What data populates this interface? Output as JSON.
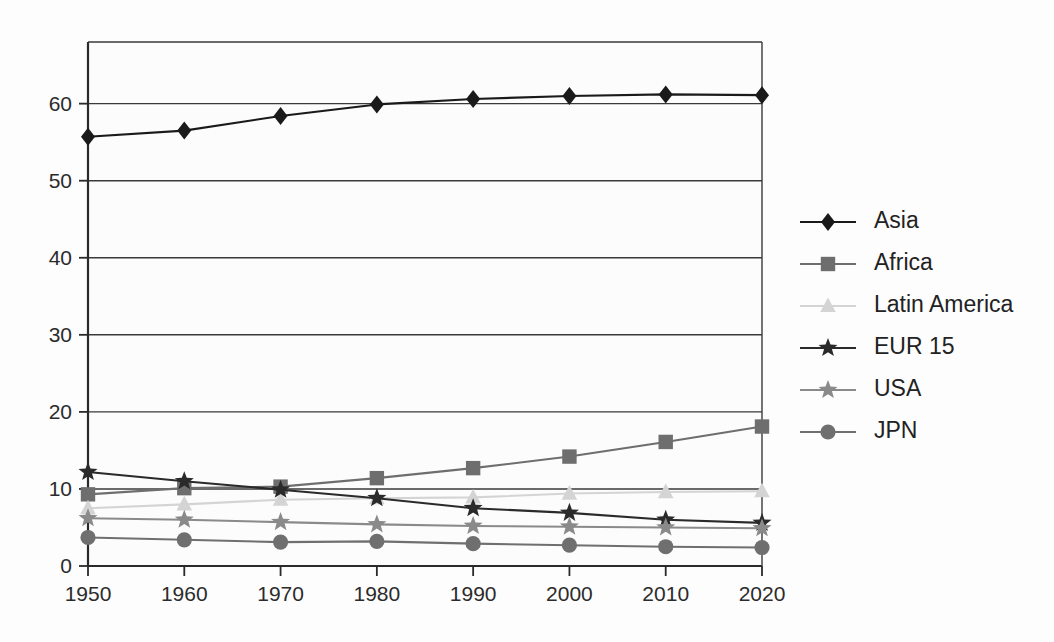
{
  "chart_data": {
    "type": "line",
    "title": "",
    "xlabel": "",
    "ylabel": "",
    "x": [
      1950,
      1960,
      1970,
      1980,
      1990,
      2000,
      2010,
      2020
    ],
    "categories": [
      "1950",
      "1960",
      "1970",
      "1980",
      "1990",
      "2000",
      "2010",
      "2020"
    ],
    "xlim": [
      1950,
      2020
    ],
    "ylim": [
      0,
      68
    ],
    "yticks": [
      0,
      10,
      20,
      30,
      40,
      50,
      60
    ],
    "ytick_labels": [
      "0",
      "10",
      "20",
      "30",
      "40",
      "50",
      "60"
    ],
    "grid": true,
    "grid_axis": "y",
    "legend_position": "right",
    "series": [
      {
        "name": "Asia",
        "marker": "diamond",
        "color": "#1a1a1a",
        "values": [
          55.7,
          56.5,
          58.4,
          59.9,
          60.6,
          61.0,
          61.2,
          61.1
        ]
      },
      {
        "name": "Africa",
        "marker": "square",
        "color": "#6e6e6e",
        "values": [
          9.3,
          10.1,
          10.3,
          11.4,
          12.7,
          14.2,
          16.1,
          18.1
        ]
      },
      {
        "name": "Latin America",
        "marker": "triangle",
        "color": "#d4d4d4",
        "values": [
          7.5,
          8.0,
          8.6,
          8.8,
          8.9,
          9.4,
          9.6,
          9.7
        ]
      },
      {
        "name": "EUR 15",
        "marker": "star",
        "color": "#2a2a2a",
        "values": [
          12.2,
          11.0,
          9.9,
          8.8,
          7.5,
          6.9,
          6.0,
          5.6
        ]
      },
      {
        "name": "USA",
        "marker": "star",
        "color": "#8a8a8a",
        "values": [
          6.2,
          6.0,
          5.7,
          5.4,
          5.2,
          5.1,
          5.0,
          4.9
        ]
      },
      {
        "name": "JPN",
        "marker": "circle",
        "color": "#6f6f6f",
        "values": [
          3.7,
          3.4,
          3.1,
          3.2,
          2.9,
          2.7,
          2.5,
          2.4
        ]
      }
    ]
  },
  "legend": {
    "items": [
      {
        "label": "Asia"
      },
      {
        "label": "Africa"
      },
      {
        "label": "Latin America"
      },
      {
        "label": "EUR 15"
      },
      {
        "label": "USA"
      },
      {
        "label": "JPN"
      }
    ]
  },
  "axes": {
    "y_tick_labels": [
      "0",
      "10",
      "20",
      "30",
      "40",
      "50",
      "60"
    ],
    "x_tick_labels": [
      "1950",
      "1960",
      "1970",
      "1980",
      "1990",
      "2000",
      "2010",
      "2020"
    ]
  },
  "colors": {
    "asia": "#1a1a1a",
    "africa": "#6e6e6e",
    "latin_america": "#d4d4d4",
    "eur15": "#2a2a2a",
    "usa": "#8a8a8a",
    "jpn": "#6f6f6f",
    "grid": "#3a3a3a",
    "axis": "#2a2a2a",
    "background": "#fdfdfd"
  }
}
